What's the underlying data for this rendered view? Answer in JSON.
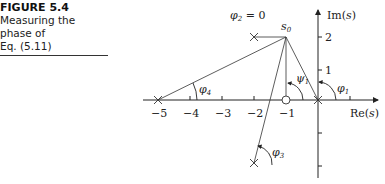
{
  "caption": {
    "figure_label": "FIGURE 5.4",
    "line1": "Measuring the phase of",
    "line2": "Eq. (5.11)"
  },
  "axes": {
    "imag_label": "Im(s)",
    "real_label": "Re(s)",
    "real_ticks": [
      "−5",
      "−4",
      "−3",
      "−2",
      "−1"
    ],
    "imag_ticks": [
      "2",
      "1"
    ]
  },
  "points": {
    "s0": "s",
    "s0_sub": "0"
  },
  "angles": {
    "phi1": "φ",
    "phi1_sub": "1",
    "psi1": "ψ",
    "psi1_sub": "1",
    "phi2": "φ",
    "phi2_sub": "2",
    "phi2_value": " = 0",
    "phi3": "φ",
    "phi3_sub": "3",
    "phi4": "φ",
    "phi4_sub": "4"
  },
  "colors": {
    "line": "#333333",
    "axis": "#222222"
  }
}
